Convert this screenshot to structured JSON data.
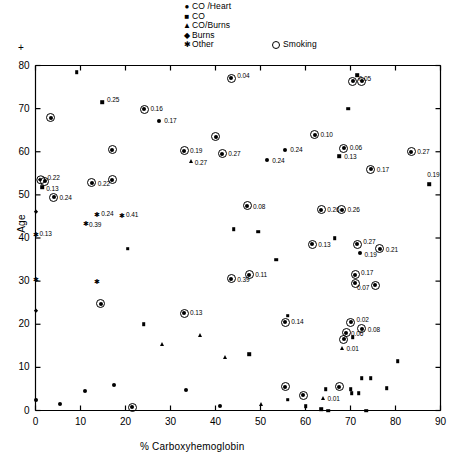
{
  "chart_data": {
    "type": "scatter",
    "title": "",
    "xlabel": "% Carboxyhemoglobin",
    "ylabel": "Age",
    "xlim": [
      0,
      90
    ],
    "ylim": [
      0,
      80
    ],
    "xticks": [
      0,
      10,
      20,
      30,
      40,
      50,
      60,
      70,
      80,
      90
    ],
    "yticks": [
      0,
      10,
      20,
      30,
      40,
      50,
      60,
      70,
      80
    ],
    "grid": false,
    "corner_mark": "+",
    "legend": {
      "position": "top-center",
      "entries": [
        {
          "marker": "circle",
          "label": "CO /Heart"
        },
        {
          "marker": "square",
          "label": "CO"
        },
        {
          "marker": "triangle",
          "label": "CO/Burns"
        },
        {
          "marker": "diamond",
          "label": "Burns"
        },
        {
          "marker": "star",
          "label": "Other"
        }
      ],
      "extra": {
        "marker": "ring",
        "label": "Smoking"
      }
    },
    "marker_meanings": {
      "circle": "CO /Heart",
      "square": "CO",
      "triangle": "CO/Burns",
      "diamond": "Burns",
      "star": "Other",
      "ring": "Smoking (open circle drawn around marker)"
    },
    "points": [
      {
        "x": 43.5,
        "y": 77.0,
        "marker": "circle",
        "ring": true,
        "label": "0.04",
        "lx": 6,
        "ly": -2
      },
      {
        "x": 71.5,
        "y": 77.8,
        "marker": "square",
        "ring": false,
        "label": "",
        "lx": 0,
        "ly": 0
      },
      {
        "x": 70.5,
        "y": 76.3,
        "marker": "circle",
        "ring": true,
        "label": "0.05",
        "lx": 6,
        "ly": -2
      },
      {
        "x": 72.5,
        "y": 76.3,
        "marker": "circle",
        "ring": true,
        "label": "",
        "lx": 0,
        "ly": 0
      },
      {
        "x": 9.2,
        "y": 78.5,
        "marker": "square",
        "ring": false,
        "label": "",
        "lx": 0,
        "ly": 0
      },
      {
        "x": 14.8,
        "y": 71.5,
        "marker": "square",
        "ring": false,
        "label": "0.25",
        "lx": 5,
        "ly": -2
      },
      {
        "x": 24.2,
        "y": 69.8,
        "marker": "circle",
        "ring": true,
        "label": "0.16",
        "lx": 6,
        "ly": 0
      },
      {
        "x": 27.5,
        "y": 67.2,
        "marker": "circle",
        "ring": false,
        "label": "0.17",
        "lx": 5,
        "ly": 0
      },
      {
        "x": 3.4,
        "y": 67.9,
        "marker": "circle",
        "ring": true,
        "label": "",
        "lx": 0,
        "ly": 0
      },
      {
        "x": 69.5,
        "y": 70.0,
        "marker": "square",
        "ring": false,
        "label": "",
        "lx": 0,
        "ly": 0
      },
      {
        "x": 62.0,
        "y": 64.0,
        "marker": "circle",
        "ring": true,
        "label": "0.10",
        "lx": 6,
        "ly": 0
      },
      {
        "x": 40.0,
        "y": 63.5,
        "marker": "circle",
        "ring": true,
        "label": "",
        "lx": 0,
        "ly": 0
      },
      {
        "x": 17.0,
        "y": 60.5,
        "marker": "circle",
        "ring": true,
        "label": "",
        "lx": 0,
        "ly": 0
      },
      {
        "x": 33.0,
        "y": 60.2,
        "marker": "circle",
        "ring": true,
        "label": "0.19",
        "lx": 6,
        "ly": 0
      },
      {
        "x": 41.5,
        "y": 59.5,
        "marker": "circle",
        "ring": true,
        "label": "0.27",
        "lx": 6,
        "ly": 0
      },
      {
        "x": 34.5,
        "y": 57.8,
        "marker": "triangle",
        "ring": false,
        "label": "0.27",
        "lx": 4,
        "ly": 2
      },
      {
        "x": 55.5,
        "y": 60.5,
        "marker": "circle",
        "ring": false,
        "label": "0.24",
        "lx": 5,
        "ly": 0
      },
      {
        "x": 51.5,
        "y": 58.0,
        "marker": "circle",
        "ring": false,
        "label": "0.24",
        "lx": 5,
        "ly": 1
      },
      {
        "x": 68.5,
        "y": 60.8,
        "marker": "circle",
        "ring": true,
        "label": "0.06",
        "lx": 6,
        "ly": 0
      },
      {
        "x": 67.5,
        "y": 59.0,
        "marker": "square",
        "ring": false,
        "label": "0.13",
        "lx": 5,
        "ly": 1
      },
      {
        "x": 83.5,
        "y": 60.0,
        "marker": "circle",
        "ring": true,
        "label": "0.27",
        "lx": 6,
        "ly": 0
      },
      {
        "x": 74.5,
        "y": 56.0,
        "marker": "circle",
        "ring": true,
        "label": "0.17",
        "lx": 6,
        "ly": 1
      },
      {
        "x": 87.5,
        "y": 52.5,
        "marker": "square",
        "ring": false,
        "label": "0.19",
        "lx": -2,
        "ly": -9
      },
      {
        "x": 1.1,
        "y": 53.5,
        "marker": "diamond",
        "ring": true,
        "label": "0.22",
        "lx": 7,
        "ly": -2
      },
      {
        "x": 2.0,
        "y": 53.2,
        "marker": "circle",
        "ring": true,
        "label": "",
        "lx": 0,
        "ly": 0
      },
      {
        "x": 1.5,
        "y": 51.8,
        "marker": "square",
        "ring": false,
        "label": "0.13",
        "lx": 4,
        "ly": 2
      },
      {
        "x": 12.5,
        "y": 52.8,
        "marker": "circle",
        "ring": true,
        "label": "0.22",
        "lx": 6,
        "ly": 1
      },
      {
        "x": 17.0,
        "y": 53.5,
        "marker": "circle",
        "ring": true,
        "label": "",
        "lx": 0,
        "ly": 0
      },
      {
        "x": 4.0,
        "y": 49.5,
        "marker": "circle",
        "ring": true,
        "label": "0.24",
        "lx": 6,
        "ly": 1
      },
      {
        "x": 0.0,
        "y": 46.0,
        "marker": "diamond",
        "ring": false,
        "label": "",
        "lx": 0,
        "ly": 0
      },
      {
        "x": 13.5,
        "y": 45.5,
        "marker": "star",
        "ring": false,
        "label": "0.24",
        "lx": 5,
        "ly": 0
      },
      {
        "x": 19.0,
        "y": 45.3,
        "marker": "star",
        "ring": false,
        "label": "0.41",
        "lx": 5,
        "ly": 0
      },
      {
        "x": 11.0,
        "y": 43.5,
        "marker": "star",
        "ring": false,
        "label": "0.39",
        "lx": 4,
        "ly": 2
      },
      {
        "x": 0.0,
        "y": 41.0,
        "marker": "star",
        "ring": false,
        "label": "0.13",
        "lx": 4,
        "ly": 0
      },
      {
        "x": 47.0,
        "y": 47.5,
        "marker": "circle",
        "ring": true,
        "label": "0.08",
        "lx": 6,
        "ly": 1
      },
      {
        "x": 63.5,
        "y": 46.5,
        "marker": "circle",
        "ring": true,
        "label": "0.26",
        "lx": 6,
        "ly": 0
      },
      {
        "x": 68.0,
        "y": 46.5,
        "marker": "circle",
        "ring": true,
        "label": "0.26",
        "lx": 6,
        "ly": 0
      },
      {
        "x": 20.5,
        "y": 37.5,
        "marker": "square",
        "ring": false,
        "label": "",
        "lx": 0,
        "ly": 0
      },
      {
        "x": 44.0,
        "y": 42.0,
        "marker": "square",
        "ring": false,
        "label": "",
        "lx": 0,
        "ly": 0
      },
      {
        "x": 49.5,
        "y": 41.5,
        "marker": "square",
        "ring": false,
        "label": "",
        "lx": 0,
        "ly": 0
      },
      {
        "x": 66.5,
        "y": 40.0,
        "marker": "square",
        "ring": false,
        "label": "",
        "lx": 0,
        "ly": 0
      },
      {
        "x": 61.5,
        "y": 38.5,
        "marker": "circle",
        "ring": true,
        "label": "0.13",
        "lx": 6,
        "ly": 1
      },
      {
        "x": 71.5,
        "y": 38.5,
        "marker": "circle",
        "ring": true,
        "label": "0.27",
        "lx": 6,
        "ly": -2
      },
      {
        "x": 72.0,
        "y": 36.5,
        "marker": "circle",
        "ring": false,
        "label": "0.19",
        "lx": 5,
        "ly": 2
      },
      {
        "x": 76.5,
        "y": 37.5,
        "marker": "circle",
        "ring": true,
        "label": "0.21",
        "lx": 6,
        "ly": 1
      },
      {
        "x": 53.5,
        "y": 35.0,
        "marker": "square",
        "ring": false,
        "label": "",
        "lx": 0,
        "ly": 0
      },
      {
        "x": 71.0,
        "y": 31.5,
        "marker": "circle",
        "ring": true,
        "label": "0.17",
        "lx": 6,
        "ly": -2
      },
      {
        "x": 71.0,
        "y": 29.5,
        "marker": "circle",
        "ring": true,
        "label": "0.07",
        "lx": 2,
        "ly": 5
      },
      {
        "x": 75.5,
        "y": 29.0,
        "marker": "circle",
        "ring": true,
        "label": "",
        "lx": 0,
        "ly": 0
      },
      {
        "x": 0.0,
        "y": 30.5,
        "marker": "star",
        "ring": false,
        "label": "",
        "lx": 0,
        "ly": 0
      },
      {
        "x": 13.5,
        "y": 30.0,
        "marker": "star",
        "ring": false,
        "label": "",
        "lx": 0,
        "ly": 0
      },
      {
        "x": 14.5,
        "y": 24.8,
        "marker": "circle",
        "ring": true,
        "label": "",
        "lx": 0,
        "ly": 0
      },
      {
        "x": 0.0,
        "y": 23.0,
        "marker": "diamond",
        "ring": false,
        "label": "",
        "lx": 0,
        "ly": 0
      },
      {
        "x": 24.0,
        "y": 20.0,
        "marker": "square",
        "ring": false,
        "label": "",
        "lx": 0,
        "ly": 0
      },
      {
        "x": 43.5,
        "y": 30.5,
        "marker": "circle",
        "ring": true,
        "label": "0.39",
        "lx": 6,
        "ly": 1
      },
      {
        "x": 47.5,
        "y": 31.5,
        "marker": "circle",
        "ring": true,
        "label": "0.11",
        "lx": 6,
        "ly": 0
      },
      {
        "x": 33.0,
        "y": 22.5,
        "marker": "circle",
        "ring": true,
        "label": "0.13",
        "lx": 6,
        "ly": 0
      },
      {
        "x": 56.0,
        "y": 22.0,
        "marker": "square",
        "ring": false,
        "label": "",
        "lx": 0,
        "ly": 0
      },
      {
        "x": 47.5,
        "y": 13.0,
        "marker": "square",
        "ring": false,
        "label": "",
        "lx": 0,
        "ly": 0
      },
      {
        "x": 55.5,
        "y": 20.5,
        "marker": "circle",
        "ring": true,
        "label": "0.14",
        "lx": 6,
        "ly": 0
      },
      {
        "x": 70.0,
        "y": 20.5,
        "marker": "circle",
        "ring": true,
        "label": "0.02",
        "lx": 6,
        "ly": -2
      },
      {
        "x": 72.5,
        "y": 19.0,
        "marker": "circle",
        "ring": true,
        "label": "0.08",
        "lx": 6,
        "ly": 1
      },
      {
        "x": 69.0,
        "y": 18.0,
        "marker": "circle",
        "ring": true,
        "label": "0.06",
        "lx": 5,
        "ly": 1
      },
      {
        "x": 70.5,
        "y": 17.0,
        "marker": "square",
        "ring": false,
        "label": "",
        "lx": 0,
        "ly": 0
      },
      {
        "x": 68.5,
        "y": 16.5,
        "marker": "circle",
        "ring": true,
        "label": "",
        "lx": 0,
        "ly": 0
      },
      {
        "x": 68.0,
        "y": 14.5,
        "marker": "triangle",
        "ring": false,
        "label": "0.01",
        "lx": 5,
        "ly": 1
      },
      {
        "x": 36.5,
        "y": 17.5,
        "marker": "triangle",
        "ring": false,
        "label": "",
        "lx": 0,
        "ly": 0
      },
      {
        "x": 28.0,
        "y": 15.5,
        "marker": "triangle",
        "ring": false,
        "label": "",
        "lx": 0,
        "ly": 0
      },
      {
        "x": 42.0,
        "y": 12.5,
        "marker": "triangle",
        "ring": false,
        "label": "",
        "lx": 0,
        "ly": 0
      },
      {
        "x": 5.5,
        "y": 1.5,
        "marker": "circle",
        "ring": false,
        "label": "",
        "lx": 0,
        "ly": 0
      },
      {
        "x": 0.0,
        "y": 2.5,
        "marker": "circle",
        "ring": false,
        "label": "",
        "lx": 0,
        "ly": 0
      },
      {
        "x": 11.0,
        "y": 4.5,
        "marker": "circle",
        "ring": false,
        "label": "",
        "lx": 0,
        "ly": 0
      },
      {
        "x": 17.5,
        "y": 6.0,
        "marker": "circle",
        "ring": false,
        "label": "",
        "lx": 0,
        "ly": 0
      },
      {
        "x": 21.5,
        "y": 0.8,
        "marker": "circle",
        "ring": true,
        "label": "",
        "lx": 0,
        "ly": 0
      },
      {
        "x": 33.5,
        "y": 4.8,
        "marker": "circle",
        "ring": false,
        "label": "",
        "lx": 0,
        "ly": 0
      },
      {
        "x": 41.0,
        "y": 1.0,
        "marker": "circle",
        "ring": false,
        "label": "",
        "lx": 0,
        "ly": 0
      },
      {
        "x": 50.0,
        "y": 1.5,
        "marker": "triangle",
        "ring": false,
        "label": "",
        "lx": 0,
        "ly": 0
      },
      {
        "x": 55.5,
        "y": 5.5,
        "marker": "circle",
        "ring": true,
        "label": "",
        "lx": 0,
        "ly": 0
      },
      {
        "x": 56.0,
        "y": 2.5,
        "marker": "square",
        "ring": false,
        "label": "",
        "lx": 0,
        "ly": 0
      },
      {
        "x": 59.5,
        "y": 3.5,
        "marker": "circle",
        "ring": true,
        "label": "",
        "lx": 0,
        "ly": 0
      },
      {
        "x": 60.0,
        "y": 1.0,
        "marker": "square",
        "ring": false,
        "label": "",
        "lx": 0,
        "ly": 0
      },
      {
        "x": 63.5,
        "y": 0.3,
        "marker": "square",
        "ring": false,
        "label": "",
        "lx": 0,
        "ly": 0
      },
      {
        "x": 65.0,
        "y": 0.0,
        "marker": "square",
        "ring": false,
        "label": "",
        "lx": 0,
        "ly": 0
      },
      {
        "x": 64.5,
        "y": 5.0,
        "marker": "square",
        "ring": false,
        "label": "",
        "lx": 0,
        "ly": 0
      },
      {
        "x": 63.8,
        "y": 2.8,
        "marker": "triangle",
        "ring": false,
        "label": "0.01",
        "lx": 5,
        "ly": 1
      },
      {
        "x": 67.5,
        "y": 5.5,
        "marker": "circle",
        "ring": true,
        "label": "",
        "lx": 0,
        "ly": 0
      },
      {
        "x": 70.0,
        "y": 5.0,
        "marker": "square",
        "ring": false,
        "label": "",
        "lx": 0,
        "ly": 0
      },
      {
        "x": 70.3,
        "y": 4.0,
        "marker": "square",
        "ring": false,
        "label": "",
        "lx": 0,
        "ly": 0
      },
      {
        "x": 71.8,
        "y": 4.0,
        "marker": "square",
        "ring": false,
        "label": "",
        "lx": 0,
        "ly": 0
      },
      {
        "x": 72.5,
        "y": 7.5,
        "marker": "square",
        "ring": false,
        "label": "",
        "lx": 0,
        "ly": 0
      },
      {
        "x": 74.5,
        "y": 7.5,
        "marker": "square",
        "ring": false,
        "label": "",
        "lx": 0,
        "ly": 0
      },
      {
        "x": 78.0,
        "y": 5.2,
        "marker": "square",
        "ring": false,
        "label": "",
        "lx": 0,
        "ly": 0
      },
      {
        "x": 80.5,
        "y": 11.5,
        "marker": "square",
        "ring": false,
        "label": "",
        "lx": 0,
        "ly": 0
      },
      {
        "x": 73.5,
        "y": 0.0,
        "marker": "square",
        "ring": false,
        "label": "",
        "lx": 0,
        "ly": 0
      }
    ]
  }
}
